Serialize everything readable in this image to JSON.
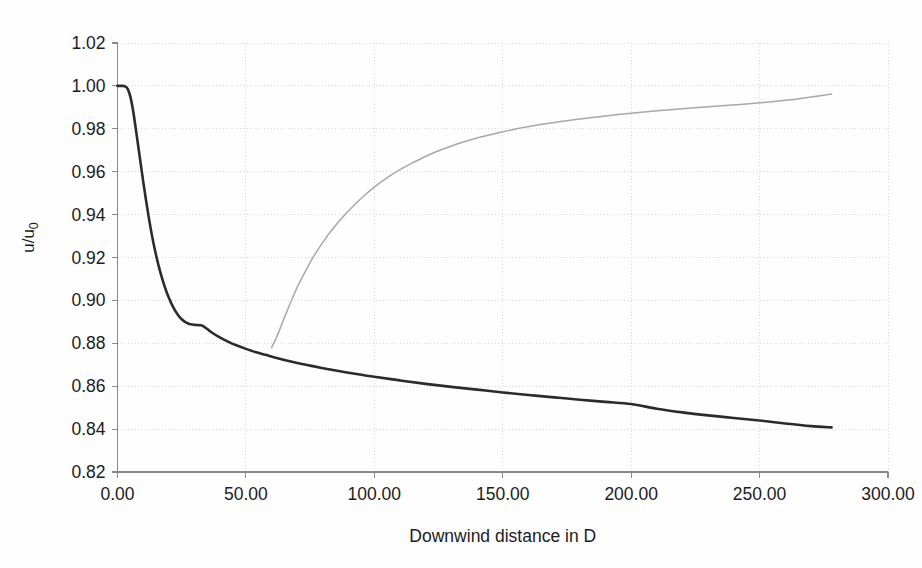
{
  "chart_data": {
    "type": "line",
    "title": "",
    "xlabel": "Downwind distance in D",
    "ylabel": "u/u0",
    "ylabel_display": "u/u",
    "ylabel_subscript": "0",
    "xlim": [
      0,
      300
    ],
    "ylim": [
      0.82,
      1.02
    ],
    "grid": true,
    "legend": "none",
    "xticks": [
      0,
      50,
      100,
      150,
      200,
      250,
      300
    ],
    "xtick_labels": [
      "0.00",
      "50.00",
      "100.00",
      "150.00",
      "200.00",
      "250.00",
      "300.00"
    ],
    "yticks": [
      0.82,
      0.84,
      0.86,
      0.88,
      0.9,
      0.92,
      0.94,
      0.96,
      0.98,
      1.0,
      1.02
    ],
    "ytick_labels": [
      "0.82",
      "0.84",
      "0.86",
      "0.88",
      "0.90",
      "0.92",
      "0.94",
      "0.96",
      "0.98",
      "1.00",
      "1.02"
    ],
    "series": [
      {
        "name": "velocity-deficit-curve",
        "color": "#2b2b2b",
        "width": 2.6,
        "points": [
          [
            0.0,
            1.0
          ],
          [
            1.5,
            1.0
          ],
          [
            3.0,
            0.9998
          ],
          [
            4.0,
            0.9985
          ],
          [
            5.0,
            0.995
          ],
          [
            6.0,
            0.989
          ],
          [
            7.0,
            0.981
          ],
          [
            8.0,
            0.9725
          ],
          [
            9.0,
            0.964
          ],
          [
            10.0,
            0.9555
          ],
          [
            11.0,
            0.9475
          ],
          [
            12.0,
            0.94
          ],
          [
            13.0,
            0.933
          ],
          [
            14.0,
            0.9268
          ],
          [
            15.0,
            0.9212
          ],
          [
            16.0,
            0.9162
          ],
          [
            17.0,
            0.9118
          ],
          [
            18.0,
            0.9078
          ],
          [
            19.0,
            0.9043
          ],
          [
            20.0,
            0.9012
          ],
          [
            21.0,
            0.8985
          ],
          [
            22.0,
            0.8962
          ],
          [
            23.0,
            0.8942
          ],
          [
            24.0,
            0.8925
          ],
          [
            25.0,
            0.8912
          ],
          [
            26.0,
            0.8902
          ],
          [
            27.0,
            0.8895
          ],
          [
            28.0,
            0.889
          ],
          [
            29.0,
            0.8888
          ],
          [
            30.0,
            0.8886
          ],
          [
            31.0,
            0.8885
          ],
          [
            32.0,
            0.8884
          ],
          [
            33.0,
            0.8882
          ],
          [
            35.0,
            0.8866
          ],
          [
            37.0,
            0.8848
          ],
          [
            40.0,
            0.8826
          ],
          [
            43.0,
            0.8808
          ],
          [
            46.0,
            0.8792
          ],
          [
            50.0,
            0.8774
          ],
          [
            54.0,
            0.8758
          ],
          [
            58.0,
            0.8745
          ],
          [
            60.0,
            0.8738
          ],
          [
            65.0,
            0.8722
          ],
          [
            70.0,
            0.8708
          ],
          [
            75.0,
            0.8696
          ],
          [
            80.0,
            0.8684
          ],
          [
            85.0,
            0.8673
          ],
          [
            90.0,
            0.8663
          ],
          [
            95.0,
            0.8653
          ],
          [
            100.0,
            0.8644
          ],
          [
            110.0,
            0.8627
          ],
          [
            120.0,
            0.8611
          ],
          [
            130.0,
            0.8597
          ],
          [
            140.0,
            0.8584
          ],
          [
            150.0,
            0.8571
          ],
          [
            160.0,
            0.8559
          ],
          [
            170.0,
            0.8548
          ],
          [
            180.0,
            0.8537
          ],
          [
            190.0,
            0.8527
          ],
          [
            200.0,
            0.8517
          ],
          [
            210.0,
            0.8495
          ],
          [
            220.0,
            0.8478
          ],
          [
            230.0,
            0.8464
          ],
          [
            240.0,
            0.8452
          ],
          [
            250.0,
            0.844
          ],
          [
            260.0,
            0.8426
          ],
          [
            270.0,
            0.8414
          ],
          [
            278.0,
            0.8408
          ]
        ]
      },
      {
        "name": "wake-recovery-curve",
        "color": "#a8a8a8",
        "width": 1.5,
        "points": [
          [
            60.0,
            0.878
          ],
          [
            62.0,
            0.883
          ],
          [
            64.0,
            0.889
          ],
          [
            66.0,
            0.895
          ],
          [
            68.0,
            0.9008
          ],
          [
            70.0,
            0.9062
          ],
          [
            73.0,
            0.9132
          ],
          [
            76.0,
            0.9198
          ],
          [
            80.0,
            0.9272
          ],
          [
            84.0,
            0.9336
          ],
          [
            88.0,
            0.9392
          ],
          [
            92.0,
            0.9442
          ],
          [
            96.0,
            0.9488
          ],
          [
            100.0,
            0.9528
          ],
          [
            105.0,
            0.9572
          ],
          [
            110.0,
            0.961
          ],
          [
            115.0,
            0.9642
          ],
          [
            120.0,
            0.9672
          ],
          [
            125.0,
            0.9698
          ],
          [
            130.0,
            0.972
          ],
          [
            135.0,
            0.974
          ],
          [
            140.0,
            0.9757
          ],
          [
            145.0,
            0.9772
          ],
          [
            150.0,
            0.9786
          ],
          [
            158.0,
            0.9806
          ],
          [
            166.0,
            0.9822
          ],
          [
            174.0,
            0.9836
          ],
          [
            182.0,
            0.9848
          ],
          [
            190.0,
            0.986
          ],
          [
            198.0,
            0.987
          ],
          [
            206.0,
            0.9879
          ],
          [
            214.0,
            0.9888
          ],
          [
            222.0,
            0.9896
          ],
          [
            230.0,
            0.9903
          ],
          [
            238.0,
            0.991
          ],
          [
            246.0,
            0.9917
          ],
          [
            254.0,
            0.9925
          ],
          [
            262.0,
            0.9935
          ],
          [
            270.0,
            0.9948
          ],
          [
            278.0,
            0.9962
          ]
        ]
      }
    ]
  },
  "axes": {
    "x_axis_title": "Downwind distance in D",
    "y_axis_title": "u/u0"
  }
}
